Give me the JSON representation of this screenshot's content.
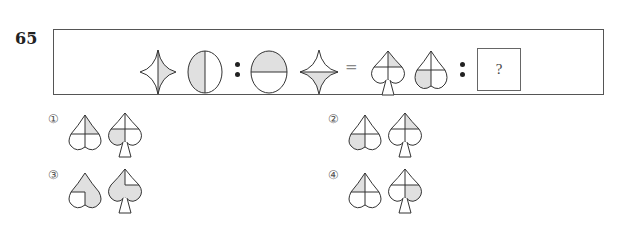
{
  "question": {
    "number": "65",
    "analogy": {
      "left_pair": [
        "four-point-star-vertical-split-right-shaded",
        "circle-vertical-split-left-shaded"
      ],
      "right_pair": [
        "circle-horizontal-split-top-shaded",
        "four-point-star-horizontal-split-bottom-shaded"
      ],
      "result_pair": [
        "spade-cross-upper-right-shaded",
        "heart-cross-lower-left-shaded"
      ],
      "separator": ":",
      "equals": "=",
      "unknown": "?"
    },
    "fill_color": "#e0e0e0",
    "stroke_color": "#333333"
  },
  "options": [
    {
      "label": "①",
      "figures": [
        "heart-cross-upper-right-shaded",
        "spade-cross-lower-left-shaded"
      ]
    },
    {
      "label": "②",
      "figures": [
        "heart-cross-lower-left-shaded",
        "spade-cross-upper-right-shaded"
      ]
    },
    {
      "label": "③",
      "figures": [
        "heart-all-shaded-except-lower-left",
        "spade-all-shaded-except-upper-right"
      ]
    },
    {
      "label": "④",
      "figures": [
        "heart-cross-upper-left-shaded",
        "spade-cross-lower-right-shaded"
      ]
    }
  ]
}
